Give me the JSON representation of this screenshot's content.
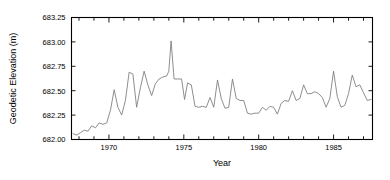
{
  "chart_data": {
    "type": "line",
    "title": "",
    "xlabel": "Year",
    "ylabel": "Geodetic Elevation (m)",
    "xlim": [
      1967.5,
      1987.6
    ],
    "ylim": [
      682.0,
      683.25
    ],
    "grid": false,
    "legend": null,
    "xticks_major": [
      1970,
      1975,
      1980,
      1985
    ],
    "xtick_labels": [
      "1970",
      "1975",
      "1980",
      "1985"
    ],
    "xticks_minor_step": 1,
    "yticks": [
      682.0,
      682.25,
      682.5,
      682.75,
      683.0,
      683.25
    ],
    "ytick_labels": [
      "682.00",
      "682.25",
      "682.50",
      "682.75",
      "683.00",
      "683.25"
    ],
    "series": [
      {
        "name": "Geodetic Elevation",
        "color": "#7a7a7a",
        "x": [
          1967.6,
          1967.85,
          1968.1,
          1968.35,
          1968.6,
          1968.85,
          1969.1,
          1969.35,
          1969.6,
          1969.85,
          1970.1,
          1970.35,
          1970.6,
          1970.85,
          1971.1,
          1971.35,
          1971.6,
          1971.85,
          1972.1,
          1972.35,
          1972.6,
          1972.85,
          1973.1,
          1973.35,
          1973.6,
          1973.85,
          1974.0,
          1974.15,
          1974.35,
          1974.6,
          1974.85,
          1975.05,
          1975.25,
          1975.5,
          1975.75,
          1976.0,
          1976.25,
          1976.5,
          1976.75,
          1977.0,
          1977.25,
          1977.5,
          1977.75,
          1978.0,
          1978.25,
          1978.5,
          1978.75,
          1979.0,
          1979.25,
          1979.5,
          1979.75,
          1980.0,
          1980.25,
          1980.5,
          1980.75,
          1981.0,
          1981.25,
          1981.5,
          1981.75,
          1982.0,
          1982.25,
          1982.5,
          1982.75,
          1983.0,
          1983.25,
          1983.5,
          1983.75,
          1984.0,
          1984.25,
          1984.5,
          1984.75,
          1985.0,
          1985.25,
          1985.5,
          1985.75,
          1986.0,
          1986.25,
          1986.5,
          1986.75,
          1987.0,
          1987.25,
          1987.5
        ],
        "y": [
          682.06,
          682.045,
          682.07,
          682.095,
          682.085,
          682.14,
          682.12,
          682.17,
          682.155,
          682.17,
          682.3,
          682.51,
          682.33,
          682.25,
          682.4,
          682.69,
          682.67,
          682.33,
          682.53,
          682.7,
          682.56,
          682.45,
          682.57,
          682.62,
          682.64,
          682.65,
          682.7,
          683.01,
          682.62,
          682.62,
          682.62,
          682.41,
          682.58,
          682.56,
          682.34,
          682.33,
          682.34,
          682.33,
          682.43,
          682.33,
          682.61,
          682.42,
          682.32,
          682.33,
          682.62,
          682.42,
          682.4,
          682.4,
          682.27,
          682.26,
          682.27,
          682.27,
          682.33,
          682.3,
          682.34,
          682.33,
          682.26,
          682.37,
          682.4,
          682.39,
          682.5,
          682.4,
          682.42,
          682.56,
          682.47,
          682.47,
          682.49,
          682.47,
          682.43,
          682.33,
          682.42,
          682.7,
          682.44,
          682.33,
          682.35,
          682.47,
          682.66,
          682.54,
          682.56,
          682.48,
          682.4,
          682.41
        ]
      }
    ]
  }
}
